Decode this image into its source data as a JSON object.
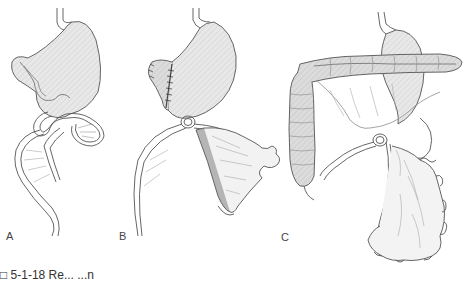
{
  "figure": {
    "type": "surgical anatomy illustration",
    "panels": [
      {
        "id": "A",
        "label": "A",
        "description": "Stomach with jejunal loop anastomosis, bowel loop with mesentery descending"
      },
      {
        "id": "B",
        "label": "B",
        "description": "Partially resected stomach with staple line, jejunal loop with mesentery and shaded segment"
      },
      {
        "id": "C",
        "label": "C",
        "description": "Stomach behind transverse colon with ascending colon, omentum and long bowel loop with ruffled mesentery"
      }
    ],
    "caption_fragment": "□ 5-1-18  Re...   ...n"
  },
  "colors": {
    "line": "#555555",
    "fill_light": "#e6e6e6",
    "fill_mid": "#d2d2d2",
    "fill_dark": "#9a9a9a",
    "background": "#ffffff"
  }
}
